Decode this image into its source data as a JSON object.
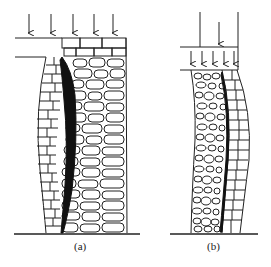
{
  "figure": {
    "panels": [
      {
        "id": "a",
        "label": "(a)",
        "description": "Masonry wall under distributed load from slab; wall bulges with vertical crack separating brick facing from rubble core",
        "load": "distributed downward arrows (5)"
      },
      {
        "id": "b",
        "label": "(b)",
        "description": "Wall under concentrated load transferred through beam; rubble core and brick facing bowing with longitudinal crack",
        "load": "single concentrated arrow on beam with 5 distributed arrows below"
      }
    ],
    "colors": {
      "line": "#222222",
      "crack": "#111111",
      "background": "#ffffff"
    }
  }
}
